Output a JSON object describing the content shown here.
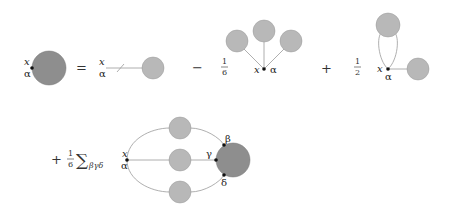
{
  "diagram": {
    "title": "",
    "colors": {
      "dark_blob": "#8e8e8e",
      "light_blob": "#b8b8b8",
      "line": "#9a9a9a",
      "vertex": "#111111"
    },
    "row1": {
      "lhs": {
        "label_top": "x",
        "label_bottom": "α"
      },
      "equals": "=",
      "term1": {
        "label_top": "x",
        "label_bottom": "α"
      },
      "op2": "−",
      "term2": {
        "coef_num": "1",
        "coef_den": "6",
        "label_left": "x",
        "label_right": "α"
      },
      "op3": "+",
      "term3": {
        "coef_num": "1",
        "coef_den": "2",
        "label_left": "x",
        "label_bottom": "α"
      }
    },
    "row2": {
      "op": "+",
      "coef_num": "1",
      "coef_den": "6",
      "sum_symbol": "∑",
      "sum_sub": "βγδ",
      "label_top": "x",
      "label_bottom": "α",
      "vertex_beta": "β",
      "vertex_gamma": "γ",
      "vertex_delta": "δ"
    }
  }
}
